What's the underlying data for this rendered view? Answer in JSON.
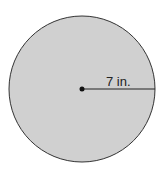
{
  "diagram": {
    "shape": "circle",
    "radius_label": "7 in.",
    "radius_value": 7,
    "unit": "in.",
    "colors": {
      "fill": "#d0d0d0",
      "stroke": "#333333",
      "background": "#ffffff"
    }
  }
}
